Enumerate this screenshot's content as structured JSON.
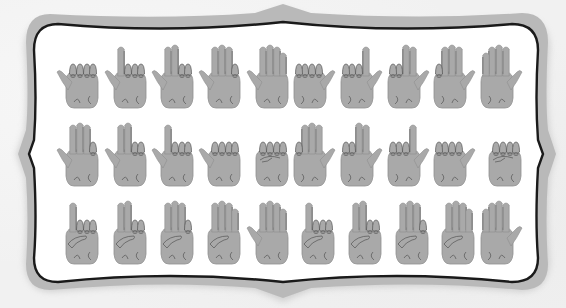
{
  "figure": {
    "colors": {
      "background": "#f1f1f1",
      "frame_band": "#b9b9b9",
      "frame_outline": "#1a1a1a",
      "frame_inner": "#ffffff",
      "hand_fill": "#a9a9a9",
      "hand_line": "#555555"
    },
    "rows": [
      {
        "name": "row-1",
        "hands": [
          {
            "fingers": 0,
            "thumb": "left",
            "pose": "fist-thumb-out"
          },
          {
            "fingers": 1,
            "thumb": "left",
            "pose": "index-up"
          },
          {
            "fingers": 2,
            "thumb": "left",
            "pose": "index-middle-up"
          },
          {
            "fingers": 3,
            "thumb": "left",
            "pose": "three-up-pinky-folded"
          },
          {
            "fingers": 4,
            "thumb": "left",
            "pose": "open-palm"
          },
          {
            "fingers": 0,
            "thumb": "right",
            "pose": "fist-thumb-out"
          },
          {
            "fingers": 1,
            "thumb": "right",
            "pose": "index-up"
          },
          {
            "fingers": 2,
            "thumb": "right",
            "pose": "index-middle-up"
          },
          {
            "fingers": 3,
            "thumb": "right",
            "pose": "three-up-pinky-folded"
          },
          {
            "fingers": 4,
            "thumb": "right",
            "pose": "open-palm"
          }
        ]
      },
      {
        "name": "row-2",
        "hands": [
          {
            "fingers": 3,
            "thumb": "left",
            "pose": "three-up-pinky-folded"
          },
          {
            "fingers": 2,
            "thumb": "left",
            "pose": "index-middle-up"
          },
          {
            "fingers": 1,
            "thumb": "left",
            "pose": "index-up"
          },
          {
            "fingers": 0,
            "thumb": "left",
            "pose": "fist-thumb-out"
          },
          {
            "fingers": 0,
            "thumb": "none",
            "pose": "closed-fist"
          },
          {
            "fingers": 3,
            "thumb": "right",
            "pose": "three-up-pinky-folded"
          },
          {
            "fingers": 2,
            "thumb": "right",
            "pose": "index-middle-up"
          },
          {
            "fingers": 1,
            "thumb": "right",
            "pose": "index-up"
          },
          {
            "fingers": 0,
            "thumb": "right",
            "pose": "fist-thumb-out"
          },
          {
            "fingers": 0,
            "thumb": "none",
            "pose": "closed-fist"
          }
        ]
      },
      {
        "name": "row-3",
        "hands": [
          {
            "fingers": 1,
            "thumb": "folded",
            "pose": "index-up-thumb-over"
          },
          {
            "fingers": 2,
            "thumb": "folded",
            "pose": "two-up-thumb-over"
          },
          {
            "fingers": 3,
            "thumb": "folded",
            "pose": "three-up-thumb-over"
          },
          {
            "fingers": 4,
            "thumb": "folded",
            "pose": "four-up-thumb-folded"
          },
          {
            "fingers": 5,
            "thumb": "left",
            "pose": "open-hand"
          },
          {
            "fingers": 1,
            "thumb": "folded",
            "pose": "index-up-thumb-over"
          },
          {
            "fingers": 2,
            "thumb": "folded",
            "pose": "two-up-thumb-over"
          },
          {
            "fingers": 3,
            "thumb": "folded",
            "pose": "three-up-thumb-over"
          },
          {
            "fingers": 4,
            "thumb": "folded",
            "pose": "four-up-thumb-folded"
          },
          {
            "fingers": 5,
            "thumb": "right",
            "pose": "open-hand"
          }
        ]
      }
    ]
  }
}
